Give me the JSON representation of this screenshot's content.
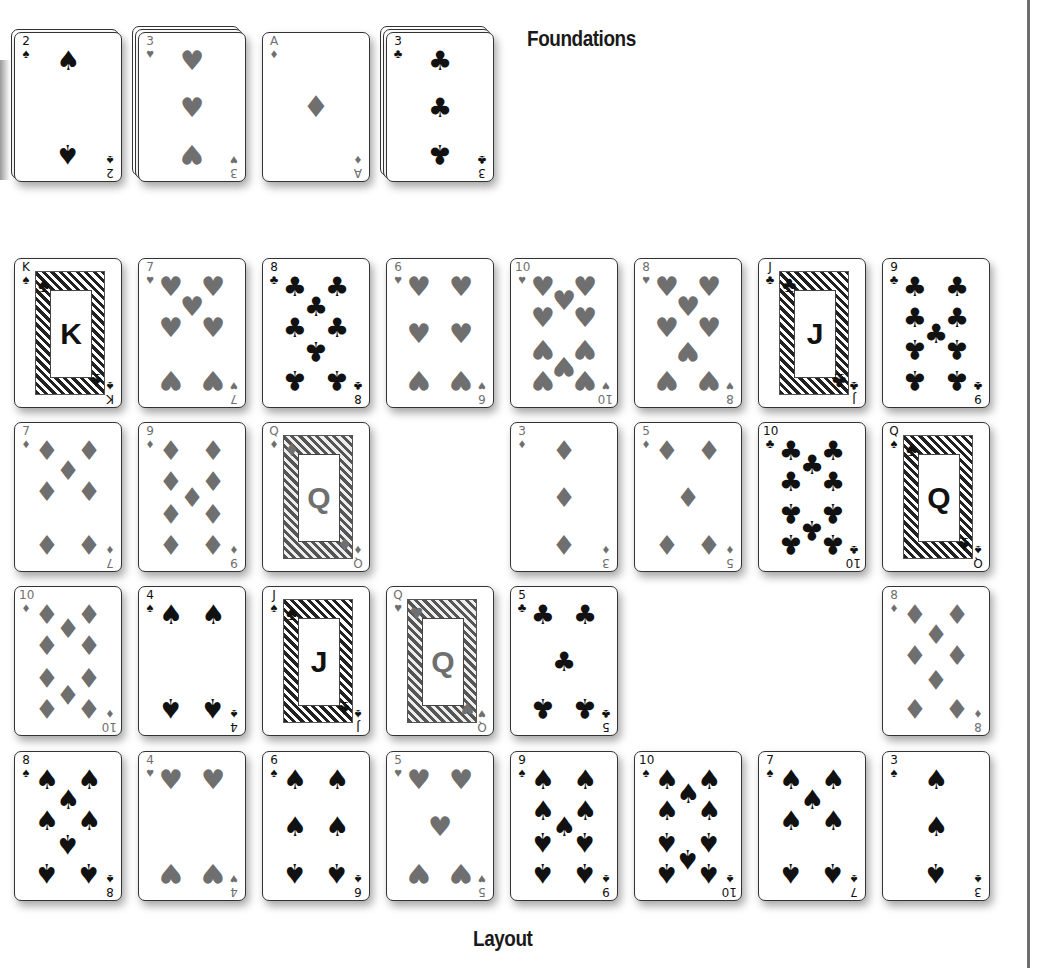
{
  "labels": {
    "foundations": "Foundations",
    "layout": "Layout"
  },
  "colors": {
    "black_suit": "#111111",
    "red_suit": "#6f6f6f",
    "rule": "#6e6e6e"
  },
  "suits": {
    "S": "♠",
    "H": "♥",
    "D": "♦",
    "C": "♣"
  },
  "foundations": [
    {
      "rank": "2",
      "suit": "S",
      "stack_depth": 2
    },
    {
      "rank": "3",
      "suit": "H",
      "stack_depth": 3
    },
    {
      "rank": "A",
      "suit": "D",
      "stack_depth": 1
    },
    {
      "rank": "3",
      "suit": "C",
      "stack_depth": 3
    }
  ],
  "layout": {
    "rows": [
      [
        {
          "rank": "K",
          "suit": "S"
        },
        {
          "rank": "7",
          "suit": "H"
        },
        {
          "rank": "8",
          "suit": "C"
        },
        {
          "rank": "6",
          "suit": "H"
        },
        {
          "rank": "10",
          "suit": "H"
        },
        {
          "rank": "8",
          "suit": "H"
        },
        {
          "rank": "J",
          "suit": "C"
        },
        {
          "rank": "9",
          "suit": "C"
        }
      ],
      [
        {
          "rank": "7",
          "suit": "D"
        },
        {
          "rank": "9",
          "suit": "D"
        },
        {
          "rank": "Q",
          "suit": "D"
        },
        null,
        {
          "rank": "3",
          "suit": "D"
        },
        {
          "rank": "5",
          "suit": "D"
        },
        {
          "rank": "10",
          "suit": "C"
        },
        {
          "rank": "Q",
          "suit": "S"
        }
      ],
      [
        {
          "rank": "10",
          "suit": "D"
        },
        {
          "rank": "4",
          "suit": "S"
        },
        {
          "rank": "J",
          "suit": "S"
        },
        {
          "rank": "Q",
          "suit": "H"
        },
        {
          "rank": "5",
          "suit": "C"
        },
        null,
        null,
        {
          "rank": "8",
          "suit": "D"
        }
      ],
      [
        {
          "rank": "8",
          "suit": "S"
        },
        {
          "rank": "4",
          "suit": "H"
        },
        {
          "rank": "6",
          "suit": "S"
        },
        {
          "rank": "5",
          "suit": "H"
        },
        {
          "rank": "9",
          "suit": "S"
        },
        {
          "rank": "10",
          "suit": "S"
        },
        {
          "rank": "7",
          "suit": "S"
        },
        {
          "rank": "3",
          "suit": "S"
        }
      ]
    ]
  }
}
